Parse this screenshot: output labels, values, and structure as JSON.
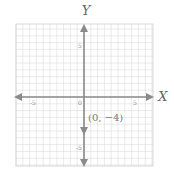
{
  "chart_data": {
    "type": "scatter",
    "title": "",
    "xlabel": "X",
    "ylabel": "Y",
    "xlim": [
      -10,
      10
    ],
    "ylim": [
      -10,
      10
    ],
    "grid": true,
    "x_ticks": [
      {
        "value": -5,
        "label": "-5"
      },
      {
        "value": 0,
        "label": "0"
      },
      {
        "value": 5,
        "label": "5"
      }
    ],
    "y_ticks": [
      {
        "value": 5,
        "label": "5"
      },
      {
        "value": -5,
        "label": "-5"
      }
    ],
    "points": [
      {
        "x": 0,
        "y": -4,
        "label": "(0, −4)"
      }
    ],
    "annotations": [
      "(0, −4)"
    ]
  },
  "labels": {
    "x_axis": "X",
    "y_axis": "Y",
    "tick_x_neg5": "-5",
    "tick_origin": "0",
    "tick_x_5": "5",
    "tick_y_5": "5",
    "tick_y_neg5": "-5",
    "point_label": "(0, −4)"
  },
  "colors": {
    "axis": "#8a8a8a",
    "grid": "#dcdcdc",
    "text": "#777777"
  }
}
